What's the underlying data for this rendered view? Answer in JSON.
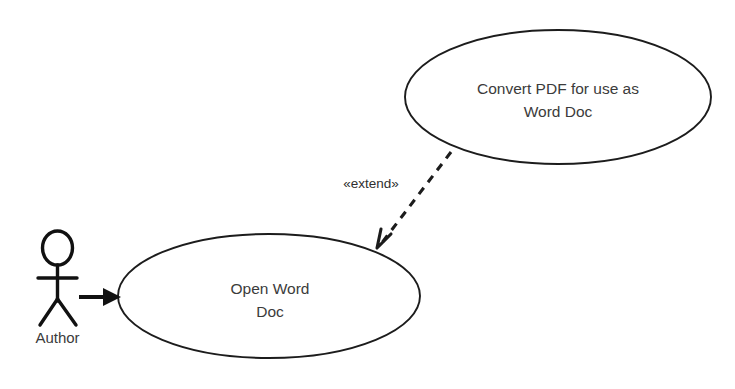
{
  "diagram": {
    "type": "uml-use-case-diagram",
    "background_color": "#ffffff",
    "stroke_color": "#1c1c1c",
    "text_color": "#3b3b3b",
    "actor": {
      "name": "Author",
      "label": "Author"
    },
    "use_cases": [
      {
        "id": "convert-pdf",
        "line1": "Convert PDF for use as",
        "line2": "Word Doc",
        "full_label": "Convert PDF for use as Word Doc"
      },
      {
        "id": "open-word-doc",
        "line1": "Open Word",
        "line2": "Doc",
        "full_label": "Open Word Doc"
      }
    ],
    "relationships": [
      {
        "id": "author-association",
        "kind": "association",
        "from": "Author",
        "to": "Open Word Doc",
        "label": "",
        "style": "solid",
        "arrowhead": "filled"
      },
      {
        "id": "extend-relationship",
        "kind": "extend",
        "from": "Convert PDF for use as Word Doc",
        "to": "Open Word Doc",
        "label": "«extend»",
        "style": "dashed",
        "arrowhead": "open"
      }
    ]
  }
}
